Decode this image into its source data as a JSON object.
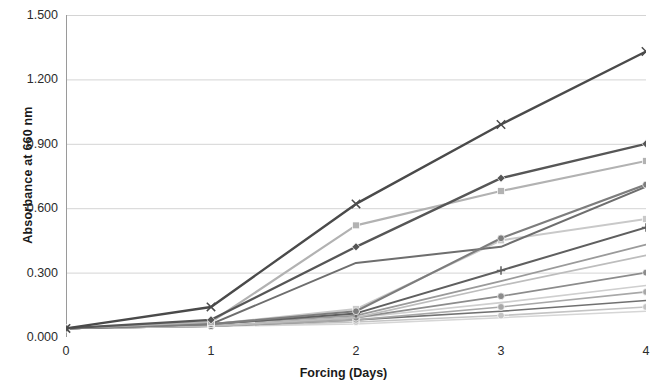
{
  "chart_data": {
    "type": "line",
    "title": "",
    "xlabel": "Forcing (Days)",
    "ylabel": "Absorbance at 660 nm",
    "x": [
      0,
      1,
      2,
      3,
      4
    ],
    "xlim": [
      0,
      4
    ],
    "ylim": [
      0.0,
      1.5
    ],
    "xticks": [
      "0",
      "1",
      "2",
      "3",
      "4"
    ],
    "yticks": [
      "0.000",
      "0.300",
      "0.600",
      "0.900",
      "1.200",
      "1.500"
    ],
    "grid": "horizontal",
    "legend": "none",
    "series": [
      {
        "name": "series-1",
        "marker": "x",
        "color": "#4a4a4a",
        "width": 2.4,
        "values": [
          0.04,
          0.14,
          0.62,
          0.99,
          1.33
        ]
      },
      {
        "name": "series-2",
        "marker": "diamond",
        "color": "#565656",
        "width": 2.3,
        "values": [
          0.04,
          0.08,
          0.42,
          0.74,
          0.9
        ]
      },
      {
        "name": "series-3",
        "marker": "square",
        "color": "#b2b2b2",
        "width": 2.2,
        "values": [
          0.04,
          0.07,
          0.52,
          0.68,
          0.82
        ]
      },
      {
        "name": "series-4",
        "marker": "circle",
        "color": "#7d7d7d",
        "width": 2.1,
        "values": [
          0.04,
          0.06,
          0.12,
          0.46,
          0.71
        ]
      },
      {
        "name": "series-5",
        "marker": "none",
        "color": "#6e6e6e",
        "width": 2.0,
        "values": [
          0.04,
          0.06,
          0.345,
          0.42,
          0.7
        ]
      },
      {
        "name": "series-6",
        "marker": "square",
        "color": "#c9c9c9",
        "width": 2.0,
        "values": [
          0.04,
          0.06,
          0.13,
          0.45,
          0.55
        ]
      },
      {
        "name": "series-7",
        "marker": "plus",
        "color": "#5f5f5f",
        "width": 2.0,
        "values": [
          0.04,
          0.06,
          0.11,
          0.31,
          0.51
        ]
      },
      {
        "name": "series-8",
        "marker": "none",
        "color": "#9a9a9a",
        "width": 1.8,
        "values": [
          0.04,
          0.06,
          0.1,
          0.26,
          0.43
        ]
      },
      {
        "name": "series-9",
        "marker": "none",
        "color": "#bdbdbd",
        "width": 1.7,
        "values": [
          0.04,
          0.05,
          0.09,
          0.24,
          0.38
        ]
      },
      {
        "name": "series-10",
        "marker": "circle",
        "color": "#8c8c8c",
        "width": 1.7,
        "values": [
          0.04,
          0.05,
          0.09,
          0.19,
          0.3
        ]
      },
      {
        "name": "series-11",
        "marker": "none",
        "color": "#cfcfcf",
        "width": 1.6,
        "values": [
          0.04,
          0.05,
          0.09,
          0.16,
          0.24
        ]
      },
      {
        "name": "series-12",
        "marker": "circle",
        "color": "#a8a8a8",
        "width": 1.6,
        "values": [
          0.04,
          0.05,
          0.08,
          0.14,
          0.21
        ]
      },
      {
        "name": "series-13",
        "marker": "none",
        "color": "#707070",
        "width": 1.6,
        "values": [
          0.04,
          0.05,
          0.08,
          0.12,
          0.17
        ]
      },
      {
        "name": "series-14",
        "marker": "circle",
        "color": "#c4c4c4",
        "width": 1.6,
        "values": [
          0.04,
          0.05,
          0.07,
          0.1,
          0.14
        ]
      },
      {
        "name": "series-15",
        "marker": "none",
        "color": "#d6d6d6",
        "width": 1.5,
        "values": [
          0.04,
          0.05,
          0.06,
          0.09,
          0.12
        ]
      }
    ]
  },
  "axes": {
    "y_title": "Absorbance at 660 nm",
    "x_title": "Forcing (Days)",
    "y_labels": [
      "1.500",
      "1.200",
      "0.900",
      "0.600",
      "0.300",
      "0.000"
    ],
    "x_labels": [
      "0",
      "1",
      "2",
      "3",
      "4"
    ]
  },
  "colors": {
    "grid": "#d4d4d4",
    "axis": "#9a9a9a",
    "text": "#1a1a1a",
    "background": "#ffffff"
  }
}
